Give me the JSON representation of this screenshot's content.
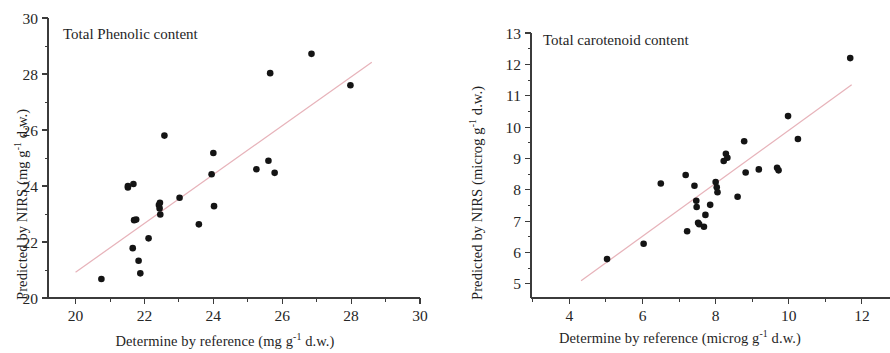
{
  "figure": {
    "background": "#ffffff",
    "point_color": "#141414",
    "line_color": "#e7b3ba",
    "axis_color": "#3b3b3b"
  },
  "chart_data": [
    {
      "type": "scatter",
      "title": "Total Phenolic content",
      "xlabel_prefix": "Determine by reference (mg g",
      "xlabel_sup": "-1",
      "xlabel_suffix": " d.w.)",
      "ylabel_prefix": "Predicted by NIRS (mg g",
      "ylabel_sup": "-1",
      "ylabel_suffix": " d.w.)",
      "xlim": [
        19.2,
        30.0
      ],
      "ylim": [
        20.0,
        30.0
      ],
      "xticks": [
        20,
        22,
        24,
        26,
        28,
        30
      ],
      "yticks": [
        20,
        22,
        24,
        26,
        28,
        30
      ],
      "xticklabels": [
        "20",
        "22",
        "24",
        "26",
        "28",
        "30"
      ],
      "yticklabels": [
        "20",
        "22",
        "24",
        "26",
        "28",
        "30"
      ],
      "xminor": [
        21,
        23,
        25,
        27,
        29
      ],
      "yminor": [
        21,
        23,
        25,
        27,
        29
      ],
      "grid": false,
      "legend": "none",
      "points": [
        [
          20.75,
          20.68
        ],
        [
          21.52,
          23.95
        ],
        [
          21.52,
          24.0
        ],
        [
          21.68,
          24.07
        ],
        [
          21.66,
          21.78
        ],
        [
          21.7,
          22.78
        ],
        [
          21.76,
          22.8
        ],
        [
          21.83,
          21.33
        ],
        [
          21.88,
          20.88
        ],
        [
          22.12,
          22.13
        ],
        [
          22.42,
          23.32
        ],
        [
          22.44,
          23.2
        ],
        [
          22.45,
          23.4
        ],
        [
          22.46,
          22.98
        ],
        [
          22.58,
          25.8
        ],
        [
          23.02,
          23.58
        ],
        [
          23.58,
          22.63
        ],
        [
          23.95,
          24.42
        ],
        [
          24.0,
          25.18
        ],
        [
          24.02,
          23.28
        ],
        [
          25.25,
          24.6
        ],
        [
          25.6,
          24.9
        ],
        [
          25.65,
          28.03
        ],
        [
          25.78,
          24.47
        ],
        [
          26.85,
          28.72
        ],
        [
          27.98,
          27.6
        ]
      ],
      "fit_line": {
        "x": [
          20.0,
          28.6
        ],
        "y": [
          20.92,
          28.42
        ]
      }
    },
    {
      "type": "scatter",
      "title": "Total carotenoid content",
      "xlabel_prefix": "Determine by reference (microg g",
      "xlabel_sup": "-1",
      "xlabel_suffix": " d.w.)",
      "ylabel_prefix": "Predicted by NIRS (microg g",
      "ylabel_sup": "-1",
      "ylabel_suffix": " d.w.)",
      "xlim": [
        2.95,
        12.85
      ],
      "ylim": [
        4.55,
        13.0
      ],
      "xticks": [
        4,
        6,
        8,
        10,
        12
      ],
      "yticks": [
        5,
        6,
        7,
        8,
        9,
        10,
        11,
        12,
        13
      ],
      "xticklabels": [
        "4",
        "6",
        "8",
        "10",
        "12"
      ],
      "yticklabels": [
        "5",
        "6",
        "7",
        "8",
        "9",
        "10",
        "11",
        "12",
        "13"
      ],
      "xminor": [
        3,
        5,
        7,
        9,
        11
      ],
      "yminor": [
        4.5,
        5.5,
        6.5,
        7.5,
        8.5,
        9.5,
        10.5,
        11.5,
        12.5
      ],
      "grid": false,
      "legend": "none",
      "points": [
        [
          5.03,
          5.79
        ],
        [
          6.03,
          6.28
        ],
        [
          6.5,
          8.2
        ],
        [
          7.18,
          8.47
        ],
        [
          7.22,
          6.68
        ],
        [
          7.42,
          8.13
        ],
        [
          7.47,
          7.65
        ],
        [
          7.48,
          7.45
        ],
        [
          7.52,
          6.95
        ],
        [
          7.55,
          6.9
        ],
        [
          7.68,
          6.82
        ],
        [
          7.72,
          7.2
        ],
        [
          7.85,
          7.52
        ],
        [
          8.0,
          8.25
        ],
        [
          8.03,
          8.08
        ],
        [
          8.05,
          7.92
        ],
        [
          8.22,
          8.92
        ],
        [
          8.28,
          9.15
        ],
        [
          8.32,
          9.02
        ],
        [
          8.6,
          7.78
        ],
        [
          8.78,
          9.55
        ],
        [
          8.82,
          8.55
        ],
        [
          9.18,
          8.65
        ],
        [
          9.68,
          8.7
        ],
        [
          9.72,
          8.62
        ],
        [
          9.98,
          10.35
        ],
        [
          10.25,
          9.62
        ],
        [
          11.68,
          12.2
        ]
      ],
      "fit_line": {
        "x": [
          4.32,
          11.72
        ],
        "y": [
          5.1,
          11.35
        ]
      }
    }
  ]
}
